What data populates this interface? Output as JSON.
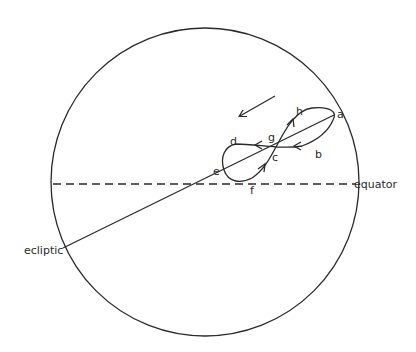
{
  "diagram": {
    "labels": {
      "ecliptic": "ecliptic",
      "equator": "equator"
    },
    "points": {
      "a": "a",
      "b": "b",
      "c": "c",
      "d": "d",
      "e": "e",
      "f": "f",
      "g": "g",
      "h": "h"
    },
    "path_order": [
      "a",
      "b",
      "c",
      "d",
      "e",
      "f",
      "g",
      "h",
      "a"
    ],
    "motion_arrow": "direction of motion (down-left)",
    "colors": {
      "ink": "#2a2a2a",
      "background": "#ffffff"
    }
  }
}
